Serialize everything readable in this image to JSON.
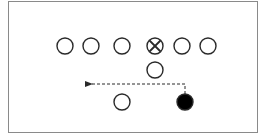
{
  "diagram": {
    "type": "football-play",
    "colors": {
      "stroke": "#2a2a2a",
      "filled": "#000000",
      "border": "#8a8a8a",
      "background": "#ffffff"
    },
    "players": [
      {
        "id": "lineman-1",
        "x": 65,
        "y": 46,
        "style": "open"
      },
      {
        "id": "lineman-2",
        "x": 91,
        "y": 46,
        "style": "open"
      },
      {
        "id": "lineman-3",
        "x": 122,
        "y": 46,
        "style": "open"
      },
      {
        "id": "center",
        "x": 155,
        "y": 46,
        "style": "crossed"
      },
      {
        "id": "lineman-5",
        "x": 182,
        "y": 46,
        "style": "open"
      },
      {
        "id": "lineman-6",
        "x": 208,
        "y": 46,
        "style": "open"
      },
      {
        "id": "quarterback",
        "x": 155,
        "y": 70,
        "style": "open"
      },
      {
        "id": "back-left",
        "x": 122,
        "y": 102,
        "style": "open"
      },
      {
        "id": "ball-carrier",
        "x": 185,
        "y": 102,
        "style": "filled"
      }
    ],
    "route": {
      "from": "ball-carrier",
      "points": [
        [
          185,
          94
        ],
        [
          185,
          84
        ],
        [
          92,
          84
        ]
      ],
      "style": "dashed",
      "arrow": "end"
    }
  }
}
